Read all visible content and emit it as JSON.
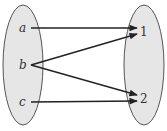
{
  "diagram": {
    "type": "function-mapping",
    "domain": {
      "elements": [
        "a",
        "b",
        "c"
      ]
    },
    "codomain": {
      "elements": [
        "1",
        "2"
      ]
    },
    "mappings": [
      {
        "from": "a",
        "to": "1"
      },
      {
        "from": "b",
        "to": "1"
      },
      {
        "from": "b",
        "to": "2"
      },
      {
        "from": "c",
        "to": "2"
      }
    ],
    "colors": {
      "set_fill": "#e6e6e6",
      "set_stroke": "#555555",
      "arrow": "#222222"
    }
  }
}
